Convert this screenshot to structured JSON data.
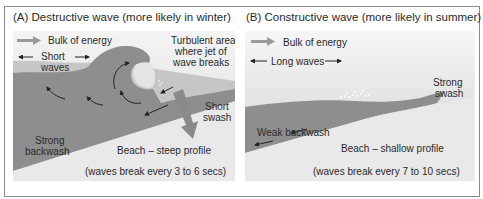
{
  "panels": [
    {
      "id": "A",
      "title": "(A) Destructive wave (more likely in winter)",
      "labels": {
        "bulk_of_energy": "Bulk of energy",
        "short_waves_1": "Short",
        "short_waves_2": "waves",
        "turbulent_1": "Turbulent area",
        "turbulent_2": "where jet of",
        "turbulent_3": "wave breaks",
        "short_swash_1": "Short",
        "short_swash_2": "swash",
        "strong_backwash_1": "Strong",
        "strong_backwash_2": "backwash",
        "beach": "Beach – steep profile",
        "timing": "(waves break every 3 to 6 secs)"
      }
    },
    {
      "id": "B",
      "title": "(B) Constructive wave (more likely in summer)",
      "labels": {
        "bulk_of_energy": "Bulk of energy",
        "long_waves": "Long waves",
        "strong_swash_1": "Strong",
        "strong_swash_2": "swash",
        "weak_backwash": "Weak backwash",
        "beach": "Beach – shallow profile",
        "timing": "(waves break every 7 to 10 secs)"
      }
    }
  ],
  "colors": {
    "water_dark": "#8e8e8e",
    "water_light": "#c9c9c9",
    "sky": "#e6e6e6",
    "beach": "#e9e9e9",
    "arrow": "#9a9a9a",
    "text": "#2a2a2a",
    "border": "#8a8a8a"
  }
}
